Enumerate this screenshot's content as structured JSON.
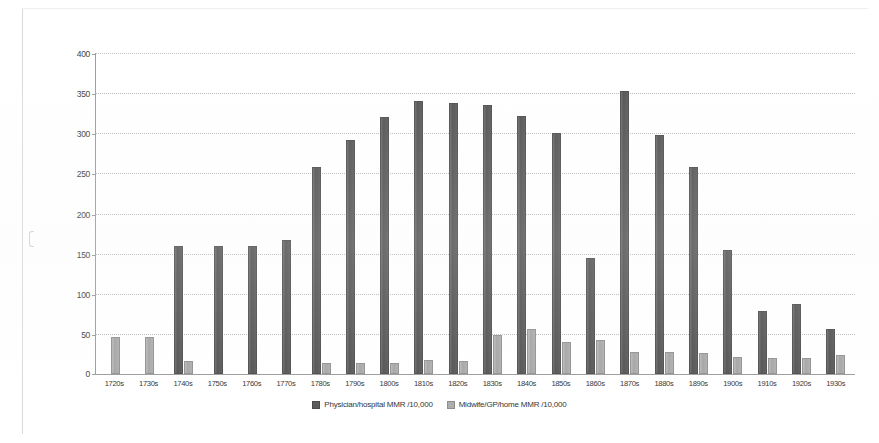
{
  "chart_data": {
    "type": "bar",
    "title": "",
    "xlabel": "",
    "ylabel": "",
    "ylim": [
      0,
      400
    ],
    "ytick_step": 50,
    "grid": true,
    "legend_position": "bottom",
    "categories": [
      "1720s",
      "1730s",
      "1740s",
      "1750s",
      "1760s",
      "1770s",
      "1780s",
      "1790s",
      "1800s",
      "1810s",
      "1820s",
      "1830s",
      "1840s",
      "1850s",
      "1860s",
      "1870s",
      "1880s",
      "1890s",
      "1900s",
      "1910s",
      "1920s",
      "1930s"
    ],
    "yticks": [
      "0",
      "50",
      "100",
      "150",
      "200",
      "250",
      "300",
      "350",
      "400"
    ],
    "series": [
      {
        "name": "Physician/hospital MMR /10,000",
        "color": "#575757",
        "values": [
          0,
          0,
          160,
          160,
          160,
          167,
          258,
          292,
          320,
          340,
          338,
          335,
          322,
          300,
          145,
          353,
          298,
          258,
          155,
          78,
          87,
          56
        ]
      },
      {
        "name": "Midwife/GP/home MMR /10,000",
        "color": "#ababab",
        "values": [
          46,
          46,
          16,
          0,
          0,
          0,
          14,
          14,
          14,
          17,
          16,
          48,
          56,
          40,
          42,
          27,
          28,
          26,
          21,
          20,
          20,
          24
        ]
      }
    ]
  },
  "legend": {
    "items": [
      {
        "label": "Physician/hospital MMR /10,000",
        "marker": "legend-swatch-physician"
      },
      {
        "label": "Midwife/GP/home MMR /10,000",
        "marker": "legend-swatch-midwife"
      }
    ]
  }
}
